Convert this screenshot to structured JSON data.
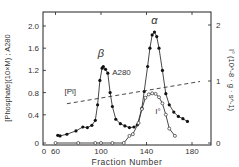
{
  "chart_data": {
    "type": "line",
    "title": "",
    "xlabel": "Fraction Number",
    "ylabel_left": "[Phosphate](10×M) ; A280",
    "ylabel_right": "I° (10^-8 · g · s^-1)",
    "x_ticks": [
      "0",
      "60",
      "100",
      "140",
      "180"
    ],
    "y_left_ticks": [
      "0",
      "0.4",
      "0.8",
      "1.2",
      "1.6",
      "2.0"
    ],
    "y_right_ticks": [
      "0",
      "1",
      "2"
    ],
    "xlim": [
      60,
      188
    ],
    "ylim_left": [
      0,
      2.2
    ],
    "ylim_right": [
      0,
      2.2
    ],
    "grid": false,
    "annotations": [
      {
        "text": "β",
        "x": 100,
        "y": 1.45
      },
      {
        "text": "α",
        "x": 147,
        "y": 2.04
      },
      {
        "text": "A280",
        "x": 118,
        "y": 1.12
      },
      {
        "text": "[Pi]",
        "x": 73,
        "y": 0.78
      },
      {
        "text": "I°",
        "x": 150,
        "y": 0.42
      }
    ],
    "series": [
      {
        "name": "A280",
        "marker": "filled-circle",
        "axis": "left",
        "x": [
          62,
          64,
          70,
          78,
          84,
          88,
          92,
          95,
          97,
          99,
          101,
          102,
          104,
          106,
          108,
          110,
          113,
          117,
          121,
          125,
          129,
          132,
          136,
          138,
          141,
          143,
          145,
          147,
          149,
          151,
          154,
          157,
          160,
          164,
          168,
          172,
          176
        ],
        "values": [
          0.03,
          0.02,
          0.05,
          0.11,
          0.18,
          0.17,
          0.21,
          0.3,
          0.58,
          1.02,
          1.24,
          1.27,
          1.22,
          1.15,
          0.8,
          0.55,
          0.32,
          0.24,
          0.2,
          0.17,
          0.18,
          0.22,
          0.52,
          0.82,
          1.27,
          1.6,
          1.84,
          1.89,
          1.81,
          1.6,
          1.2,
          0.78,
          0.58,
          0.45,
          0.37,
          0.33,
          0.28
        ]
      },
      {
        "name": "I°",
        "marker": "open-circle",
        "axis": "right",
        "x": [
          60,
          80,
          95,
          100,
          110,
          120,
          125,
          128,
          133,
          136,
          139,
          142,
          145,
          148,
          151,
          154,
          157,
          160,
          165
        ],
        "values": [
          0,
          0,
          0,
          0,
          0,
          0,
          0.02,
          0.05,
          0.25,
          0.5,
          0.7,
          0.76,
          0.78,
          0.77,
          0.71,
          0.6,
          0.4,
          0.15,
          0.02
        ]
      },
      {
        "name": "[Pi]",
        "marker": "none",
        "style": "dashed",
        "axis": "left",
        "x": [
          70,
          187
        ],
        "values": [
          0.6,
          1.0
        ]
      }
    ]
  }
}
